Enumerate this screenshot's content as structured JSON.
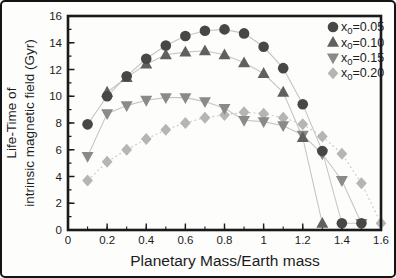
{
  "figure": {
    "xlabel": "Planetary Mass/Earth mass",
    "ylabel_line1": "Life-Time of",
    "ylabel_line2": "intrinsic magnetic field (Gyr)"
  },
  "chart_data": {
    "type": "scatter",
    "title": "",
    "xlabel": "Planetary Mass/Earth mass",
    "ylabel": "Life-Time of intrinsic magnetic field (Gyr)",
    "xlim": [
      0,
      1.6
    ],
    "ylim": [
      0,
      16
    ],
    "x_ticks": [
      0,
      0.2,
      0.4,
      0.6,
      0.8,
      1,
      1.2,
      1.4,
      1.6
    ],
    "x_tick_labels": [
      "0",
      "0.2",
      "0.4",
      "0.6",
      "0.8",
      "1",
      "1.2",
      "1.4",
      "1.6"
    ],
    "x_minor_step": 0.1,
    "y_ticks": [
      0,
      2,
      4,
      6,
      8,
      10,
      12,
      14,
      16
    ],
    "y_tick_labels": [
      "0",
      "2",
      "4",
      "6",
      "8",
      "10",
      "12",
      "14",
      "16"
    ],
    "y_minor_step": 1,
    "grid": false,
    "legend_position": "top-right",
    "connector_line_color": "#c6c6c6",
    "frame_color": "#1a1a1a",
    "series": [
      {
        "name": "x0=0.05",
        "label_base": "x",
        "label_sub": "0",
        "label_rest": "=0.05",
        "marker": "circle",
        "color": "#474747",
        "line_style": "solid",
        "x": [
          0.1,
          0.2,
          0.3,
          0.4,
          0.5,
          0.6,
          0.7,
          0.8,
          0.9,
          1.0,
          1.1,
          1.2,
          1.3,
          1.4,
          1.5
        ],
        "y": [
          7.9,
          10.0,
          11.5,
          12.8,
          13.8,
          14.5,
          14.9,
          15.0,
          14.7,
          13.7,
          12.1,
          9.4,
          5.9,
          0.5,
          0.5
        ]
      },
      {
        "name": "x0=0.10",
        "label_base": "x",
        "label_sub": "0",
        "label_rest": "=0.10",
        "marker": "triangle-up",
        "color": "#606060",
        "line_style": "solid",
        "x": [
          0.2,
          0.3,
          0.4,
          0.5,
          0.6,
          0.7,
          0.8,
          0.9,
          1.0,
          1.1,
          1.2,
          1.3
        ],
        "y": [
          10.3,
          11.4,
          12.4,
          13.1,
          13.3,
          13.4,
          13.1,
          12.5,
          11.7,
          10.3,
          6.9,
          0.5
        ]
      },
      {
        "name": "x0=0.15",
        "label_base": "x",
        "label_sub": "0",
        "label_rest": "=0.15",
        "marker": "triangle-down",
        "color": "#8a8a8a",
        "line_style": "solid",
        "x": [
          0.1,
          0.2,
          0.3,
          0.4,
          0.5,
          0.6,
          0.7,
          0.8,
          0.9,
          1.0,
          1.1,
          1.2,
          1.3,
          1.4,
          1.5
        ],
        "y": [
          5.5,
          8.7,
          9.3,
          9.7,
          9.9,
          9.9,
          9.6,
          9.1,
          8.2,
          8.1,
          7.8,
          7.1,
          5.7,
          3.7,
          0.5
        ]
      },
      {
        "name": "x0=0.20",
        "label_base": "x",
        "label_sub": "0",
        "label_rest": "=0.20",
        "marker": "diamond",
        "color": "#b5b5b5",
        "line_style": "dotted",
        "x": [
          0.1,
          0.2,
          0.3,
          0.4,
          0.5,
          0.6,
          0.7,
          0.8,
          0.9,
          1.0,
          1.1,
          1.2,
          1.3,
          1.4,
          1.5,
          1.6
        ],
        "y": [
          3.7,
          5.1,
          6.0,
          6.8,
          7.5,
          8.0,
          8.4,
          8.6,
          8.8,
          8.7,
          8.4,
          7.9,
          7.0,
          5.7,
          3.5,
          0.5
        ]
      }
    ]
  }
}
